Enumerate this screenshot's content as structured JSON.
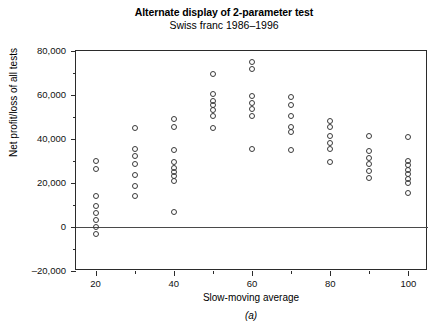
{
  "figure": {
    "title": "Alternate display of 2-parameter test",
    "subtitle": "Swiss franc 1986–1996",
    "panel_caption": "(a)"
  },
  "chart_data": {
    "type": "scatter",
    "title": "Alternate display of 2-parameter test",
    "subtitle": "Swiss franc 1986–1996",
    "xlabel": "Slow-moving average",
    "ylabel": "Net profit/loss of all tests",
    "xlim": [
      15,
      105
    ],
    "ylim": [
      -20000,
      80000
    ],
    "xticks": [
      20,
      40,
      60,
      80,
      100
    ],
    "xtick_labels": [
      "20",
      "40",
      "60",
      "80",
      "100"
    ],
    "xminorticks": [
      30,
      50,
      70,
      90
    ],
    "yticks": [
      -20000,
      0,
      20000,
      40000,
      60000,
      80000
    ],
    "ytick_labels": [
      "–20,000",
      "0",
      "20,000",
      "40,000",
      "60,000",
      "80,000"
    ],
    "yminorticks": [
      -10000,
      10000,
      30000,
      50000,
      70000
    ],
    "grid": false,
    "legend": false,
    "zero_line": 0,
    "marker": "open-circle",
    "marker_color": "#3a3a3a",
    "series": [
      {
        "name": "Net profit/loss of all tests",
        "points": [
          {
            "x": 20,
            "y": 30000
          },
          {
            "x": 20,
            "y": 26500
          },
          {
            "x": 20,
            "y": 14000
          },
          {
            "x": 20,
            "y": 9500
          },
          {
            "x": 20,
            "y": 6500
          },
          {
            "x": 20,
            "y": 3000
          },
          {
            "x": 20,
            "y": 0
          },
          {
            "x": 20,
            "y": -3000
          },
          {
            "x": 30,
            "y": 45000
          },
          {
            "x": 30,
            "y": 35500
          },
          {
            "x": 30,
            "y": 32500
          },
          {
            "x": 30,
            "y": 28500
          },
          {
            "x": 30,
            "y": 23500
          },
          {
            "x": 30,
            "y": 18500
          },
          {
            "x": 30,
            "y": 14000
          },
          {
            "x": 40,
            "y": 49000
          },
          {
            "x": 40,
            "y": 45500
          },
          {
            "x": 40,
            "y": 35000
          },
          {
            "x": 40,
            "y": 29500
          },
          {
            "x": 40,
            "y": 27000
          },
          {
            "x": 40,
            "y": 25000
          },
          {
            "x": 40,
            "y": 23000
          },
          {
            "x": 40,
            "y": 21000
          },
          {
            "x": 40,
            "y": 7000
          },
          {
            "x": 50,
            "y": 69500
          },
          {
            "x": 50,
            "y": 60500
          },
          {
            "x": 50,
            "y": 57500
          },
          {
            "x": 50,
            "y": 55500
          },
          {
            "x": 50,
            "y": 53000
          },
          {
            "x": 50,
            "y": 50500
          },
          {
            "x": 50,
            "y": 45000
          },
          {
            "x": 60,
            "y": 75000
          },
          {
            "x": 60,
            "y": 72000
          },
          {
            "x": 60,
            "y": 59500
          },
          {
            "x": 60,
            "y": 56500
          },
          {
            "x": 60,
            "y": 53500
          },
          {
            "x": 60,
            "y": 50500
          },
          {
            "x": 60,
            "y": 35500
          },
          {
            "x": 70,
            "y": 59000
          },
          {
            "x": 70,
            "y": 55500
          },
          {
            "x": 70,
            "y": 50500
          },
          {
            "x": 70,
            "y": 45500
          },
          {
            "x": 70,
            "y": 43000
          },
          {
            "x": 70,
            "y": 35000
          },
          {
            "x": 80,
            "y": 48000
          },
          {
            "x": 80,
            "y": 45500
          },
          {
            "x": 80,
            "y": 41500
          },
          {
            "x": 80,
            "y": 38000
          },
          {
            "x": 80,
            "y": 35500
          },
          {
            "x": 80,
            "y": 29500
          },
          {
            "x": 90,
            "y": 41500
          },
          {
            "x": 90,
            "y": 34500
          },
          {
            "x": 90,
            "y": 31500
          },
          {
            "x": 90,
            "y": 28500
          },
          {
            "x": 90,
            "y": 25500
          },
          {
            "x": 90,
            "y": 22500
          },
          {
            "x": 100,
            "y": 41000
          },
          {
            "x": 100,
            "y": 30000
          },
          {
            "x": 100,
            "y": 28000
          },
          {
            "x": 100,
            "y": 26000
          },
          {
            "x": 100,
            "y": 24000
          },
          {
            "x": 100,
            "y": 22000
          },
          {
            "x": 100,
            "y": 20000
          },
          {
            "x": 100,
            "y": 15500
          }
        ]
      }
    ]
  }
}
